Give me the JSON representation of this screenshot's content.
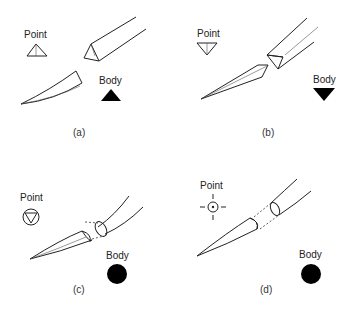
{
  "figure": {
    "panels": [
      {
        "id": "a",
        "caption": "(a)",
        "point_label": "Point",
        "body_label": "Body",
        "point_shape": "triangle-up-outline-with-center-line",
        "body_shape": "triangle-up-filled"
      },
      {
        "id": "b",
        "caption": "(b)",
        "point_label": "Point",
        "body_label": "Body",
        "point_shape": "triangle-down-outline-with-center-line",
        "body_shape": "triangle-down-filled"
      },
      {
        "id": "c",
        "caption": "(c)",
        "point_label": "Point",
        "body_label": "Body",
        "point_shape": "circle-with-inverted-triangle",
        "body_shape": "circle-filled"
      },
      {
        "id": "d",
        "caption": "(d)",
        "point_label": "Point",
        "body_label": "Body",
        "point_shape": "circle-with-dot-crosshair",
        "body_shape": "circle-filled"
      }
    ]
  },
  "colors": {
    "line": "#222222",
    "fill": "#000000",
    "background": "#ffffff"
  }
}
